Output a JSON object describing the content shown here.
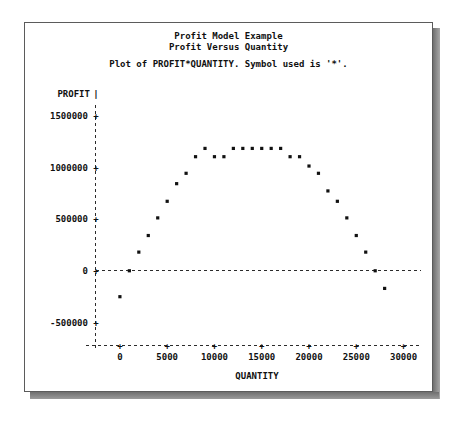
{
  "window": {
    "title_line_1": "Profit Model Example",
    "title_line_2": "Profit Versus Quantity",
    "subtitle": "Plot of PROFIT*QUANTITY.  Symbol used is '*'."
  },
  "chart_data": {
    "type": "scatter",
    "subtitle": "Plot of PROFIT*QUANTITY.  Symbol used is '*'.",
    "xlabel": "QUANTITY",
    "ylabel": "PROFIT",
    "symbol": "*",
    "grid": false,
    "legend": null,
    "xlim": [
      -2000,
      31000
    ],
    "ylim": [
      -600000,
      1560000
    ],
    "xticks": [
      0,
      5000,
      10000,
      15000,
      20000,
      25000,
      30000
    ],
    "xticklabels": [
      "0",
      "5000",
      "10000",
      "15000",
      "20000",
      "25000",
      "30000"
    ],
    "yticks": [
      -500000,
      0,
      500000,
      1000000,
      1500000
    ],
    "yticklabels": [
      "-500000",
      "0",
      "500000",
      "1000000",
      "1500000"
    ],
    "zero_reference_line": 0,
    "x": [
      0,
      1000,
      2000,
      3000,
      4000,
      5000,
      6000,
      7000,
      8000,
      9000,
      10000,
      11000,
      12000,
      13000,
      14000,
      15000,
      16000,
      17000,
      18000,
      19000,
      20000,
      21000,
      22000,
      23000,
      24000,
      25000,
      26000,
      27000,
      28000
    ],
    "y": [
      -250000,
      0,
      180000,
      340000,
      510000,
      670000,
      840000,
      940000,
      1100000,
      1180000,
      1100000,
      1100000,
      1180000,
      1180000,
      1180000,
      1180000,
      1180000,
      1180000,
      1100000,
      1100000,
      1010000,
      940000,
      770000,
      670000,
      510000,
      340000,
      180000,
      0,
      -170000
    ]
  }
}
